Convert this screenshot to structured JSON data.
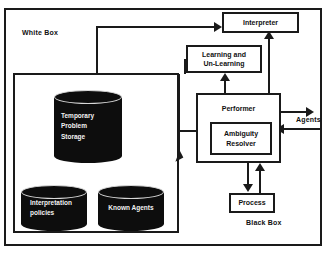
{
  "diagram": {
    "regions": {
      "white_box_label": "White Box",
      "black_box_label": "Black Box",
      "external_actor_label": "Agents"
    },
    "boxes": {
      "interpreter": "Interpreter",
      "learning_line1": "Learning and",
      "learning_line2": "Un-Learning",
      "performer": "Performer",
      "ambiguity_line1": "Ambiguity",
      "ambiguity_line2": "Resolver",
      "process": "Process"
    },
    "datastores": {
      "temporary_storage_line1": "Temporary",
      "temporary_storage_line2": "Problem",
      "temporary_storage_line3": "Storage",
      "interpretation_policies_line1": "Interpretation",
      "interpretation_policies_line2": "policies",
      "known_agents": "Known Agents"
    },
    "colors": {
      "stroke": "#1a1a1a",
      "cylinder_fill": "#0d0d0d",
      "cylinder_text": "#f2f2f2",
      "hatch_light": "#f2f2f2",
      "hatch_dark": "#cfcfcf",
      "background": "#ffffff"
    },
    "connections": [
      {
        "from": "Temporary Problem Storage area",
        "to": "Interpreter",
        "direction": "right"
      },
      {
        "from": "Learning and Un-Learning",
        "to": "White Box store area",
        "direction": "down-left"
      },
      {
        "from": "Performer",
        "to": "Learning and Un-Learning",
        "direction": "up"
      },
      {
        "from": "Performer",
        "to": "Interpreter",
        "direction": "up"
      },
      {
        "from": "Performer",
        "to": "Agents",
        "direction": "right"
      },
      {
        "from": "Agents",
        "to": "Ambiguity Resolver",
        "direction": "left"
      },
      {
        "from": "Performer",
        "to": "Process",
        "direction": "down"
      },
      {
        "from": "Process",
        "to": "Performer",
        "direction": "up"
      }
    ]
  }
}
